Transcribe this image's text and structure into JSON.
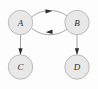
{
  "figure": {
    "background_color": "#fdfdfd",
    "width": 98,
    "height": 89
  },
  "style": {
    "node_fill": "#e8e8e8",
    "node_stroke": "#b5b5b5",
    "edge_color": "#9a9a9a",
    "arrow_color": "#2b2b2b",
    "label_color": "#2a2a2a"
  },
  "nodes": [
    {
      "id": "A",
      "label": "A",
      "cx": 20.5,
      "cy": 22.5,
      "r": 12.2
    },
    {
      "id": "B",
      "label": "B",
      "cx": 77.0,
      "cy": 22.5,
      "r": 12.2
    },
    {
      "id": "C",
      "label": "C",
      "cx": 20.5,
      "cy": 67.0,
      "r": 12.2
    },
    {
      "id": "D",
      "label": "D",
      "cx": 77.0,
      "cy": 67.0,
      "r": 12.2
    }
  ],
  "edges": [
    {
      "id": "A-to-B",
      "from": "A",
      "to": "B",
      "shape": "curved",
      "direction": "right",
      "label": ""
    },
    {
      "id": "B-to-A",
      "from": "B",
      "to": "A",
      "shape": "curved",
      "direction": "left",
      "label": ""
    },
    {
      "id": "A-to-C",
      "from": "A",
      "to": "C",
      "shape": "straight",
      "direction": "down",
      "label": ""
    },
    {
      "id": "B-to-D",
      "from": "B",
      "to": "D",
      "shape": "straight",
      "direction": "down",
      "label": ""
    }
  ]
}
